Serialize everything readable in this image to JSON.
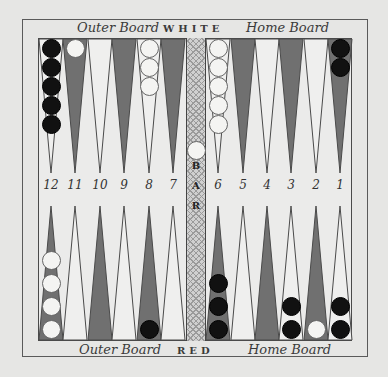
{
  "board": {
    "top_labels": {
      "left": "Outer Board",
      "center": "WHITE",
      "right": "Home Board"
    },
    "bottom_labels": {
      "left": "Outer Board",
      "center": "RED",
      "right": "Home Board"
    },
    "bar_label": [
      "B",
      "A",
      "R"
    ],
    "point_numbers": [
      "12",
      "11",
      "10",
      "9",
      "8",
      "7",
      "6",
      "5",
      "4",
      "3",
      "2",
      "1"
    ],
    "colors": {
      "background": "#e6e6e4",
      "dark_point": "#707070",
      "light_point": "#efefee",
      "black_checker": "#111111",
      "white_checker": "#f4f4f2"
    },
    "top_points": [
      {
        "number": "12",
        "shade": "light",
        "checkers": {
          "color": "black",
          "count": 5
        }
      },
      {
        "number": "11",
        "shade": "dark",
        "checkers": {
          "color": "white",
          "count": 1
        }
      },
      {
        "number": "10",
        "shade": "light",
        "checkers": null
      },
      {
        "number": "9",
        "shade": "dark",
        "checkers": null
      },
      {
        "number": "8",
        "shade": "light",
        "checkers": {
          "color": "white",
          "count": 3
        }
      },
      {
        "number": "7",
        "shade": "dark",
        "checkers": null
      },
      {
        "number": "6",
        "shade": "light",
        "checkers": {
          "color": "white",
          "count": 5
        }
      },
      {
        "number": "5",
        "shade": "dark",
        "checkers": null
      },
      {
        "number": "4",
        "shade": "light",
        "checkers": null
      },
      {
        "number": "3",
        "shade": "dark",
        "checkers": null
      },
      {
        "number": "2",
        "shade": "light",
        "checkers": null
      },
      {
        "number": "1",
        "shade": "dark",
        "checkers": {
          "color": "black",
          "count": 2
        }
      }
    ],
    "bottom_points": [
      {
        "number": "12",
        "shade": "dark",
        "checkers": {
          "color": "white",
          "count": 4
        }
      },
      {
        "number": "11",
        "shade": "light",
        "checkers": null
      },
      {
        "number": "10",
        "shade": "dark",
        "checkers": null
      },
      {
        "number": "9",
        "shade": "light",
        "checkers": null
      },
      {
        "number": "8",
        "shade": "dark",
        "checkers": {
          "color": "black",
          "count": 1
        }
      },
      {
        "number": "7",
        "shade": "light",
        "checkers": null
      },
      {
        "number": "6",
        "shade": "dark",
        "checkers": {
          "color": "black",
          "count": 3
        }
      },
      {
        "number": "5",
        "shade": "light",
        "checkers": null
      },
      {
        "number": "4",
        "shade": "dark",
        "checkers": null
      },
      {
        "number": "3",
        "shade": "light",
        "checkers": {
          "color": "black",
          "count": 2
        }
      },
      {
        "number": "2",
        "shade": "dark",
        "checkers": {
          "color": "white",
          "count": 1
        }
      },
      {
        "number": "1",
        "shade": "light",
        "checkers": {
          "color": "black",
          "count": 2
        }
      }
    ],
    "bar_checkers": [
      {
        "color": "white",
        "count": 1,
        "side": "top"
      }
    ]
  }
}
